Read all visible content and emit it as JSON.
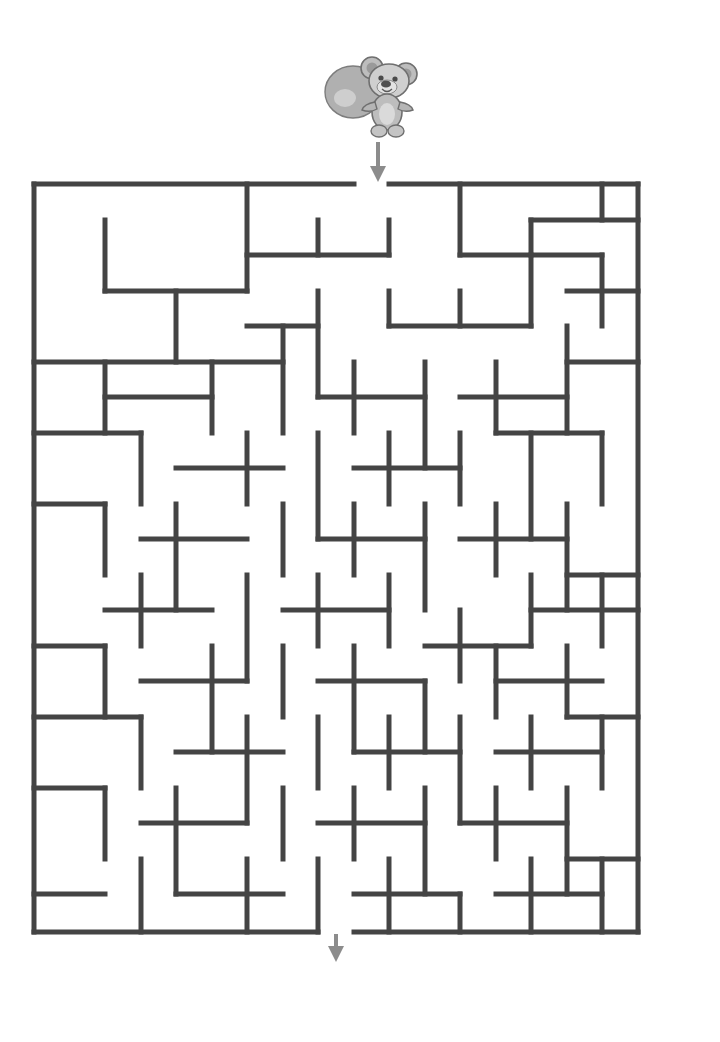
{
  "page": {
    "background_color": "#ffffff"
  },
  "mascot": {
    "name": "koala-bear-with-balloon",
    "description": "Grayscale cartoon koala bear holding a round balloon",
    "x": 320,
    "y": 50,
    "width": 100,
    "height": 92,
    "colors": {
      "body_light": "#c9c9c9",
      "body_mid": "#a8a8a8",
      "body_dark": "#8a8a8a",
      "outline": "#6f6f6f",
      "balloon": "#b3b3b3",
      "balloon_highlight": "#d8d8d8"
    }
  },
  "entry_arrow": {
    "name": "entrance-arrow-down",
    "x": 378,
    "y": 140,
    "length": 40,
    "color": "#8c8c8c"
  },
  "exit_arrow": {
    "name": "exit-arrow-down",
    "x": 336,
    "y": 930,
    "length": 32,
    "color": "#8c8c8c"
  },
  "maze": {
    "origin_x": 34,
    "origin_y": 184,
    "cols": 17,
    "rows": 21,
    "cell": 35.5,
    "wall_color": "#444444",
    "wall_width": 5,
    "entrance": {
      "side": "top",
      "col": 9
    },
    "exit": {
      "side": "bottom",
      "col": 8
    },
    "walls": [
      [
        0,
        0,
        0,
        748,
        "v"
      ],
      [
        604,
        0,
        604,
        748,
        "v"
      ],
      [
        0,
        0,
        320,
        0,
        "h"
      ],
      [
        355,
        0,
        604,
        0,
        "h"
      ],
      [
        0,
        748,
        284,
        748,
        "h"
      ],
      [
        320,
        748,
        604,
        748,
        "h"
      ],
      [
        71,
        36,
        71,
        107,
        "v"
      ],
      [
        213,
        0,
        213,
        107,
        "v"
      ],
      [
        284,
        36,
        284,
        71,
        "v"
      ],
      [
        355,
        36,
        355,
        71,
        "v"
      ],
      [
        426,
        0,
        426,
        71,
        "v"
      ],
      [
        497,
        36,
        497,
        71,
        "v"
      ],
      [
        568,
        0,
        568,
        36,
        "v"
      ],
      [
        71,
        107,
        213,
        107,
        "h"
      ],
      [
        213,
        71,
        355,
        71,
        "h"
      ],
      [
        426,
        71,
        568,
        71,
        "h"
      ],
      [
        497,
        36,
        604,
        36,
        "h"
      ],
      [
        142,
        107,
        142,
        178,
        "v"
      ],
      [
        284,
        107,
        284,
        213,
        "v"
      ],
      [
        355,
        107,
        355,
        142,
        "v"
      ],
      [
        426,
        107,
        426,
        142,
        "v"
      ],
      [
        497,
        71,
        497,
        142,
        "v"
      ],
      [
        568,
        71,
        568,
        142,
        "v"
      ],
      [
        0,
        178,
        249,
        178,
        "h"
      ],
      [
        213,
        142,
        284,
        142,
        "h"
      ],
      [
        355,
        142,
        497,
        142,
        "h"
      ],
      [
        533,
        107,
        604,
        107,
        "h"
      ],
      [
        71,
        178,
        71,
        249,
        "v"
      ],
      [
        178,
        178,
        178,
        249,
        "v"
      ],
      [
        249,
        142,
        249,
        249,
        "v"
      ],
      [
        320,
        178,
        320,
        249,
        "v"
      ],
      [
        391,
        178,
        391,
        284,
        "v"
      ],
      [
        462,
        178,
        462,
        249,
        "v"
      ],
      [
        533,
        142,
        533,
        249,
        "v"
      ],
      [
        71,
        213,
        178,
        213,
        "h"
      ],
      [
        284,
        213,
        391,
        213,
        "h"
      ],
      [
        426,
        213,
        533,
        213,
        "h"
      ],
      [
        533,
        178,
        604,
        178,
        "h"
      ],
      [
        107,
        249,
        107,
        320,
        "v"
      ],
      [
        213,
        249,
        213,
        320,
        "v"
      ],
      [
        284,
        249,
        284,
        355,
        "v"
      ],
      [
        355,
        249,
        355,
        320,
        "v"
      ],
      [
        426,
        249,
        426,
        320,
        "v"
      ],
      [
        497,
        249,
        497,
        355,
        "v"
      ],
      [
        568,
        249,
        568,
        320,
        "v"
      ],
      [
        0,
        249,
        107,
        249,
        "h"
      ],
      [
        142,
        284,
        249,
        284,
        "h"
      ],
      [
        320,
        284,
        426,
        284,
        "h"
      ],
      [
        462,
        249,
        568,
        249,
        "h"
      ],
      [
        71,
        320,
        71,
        391,
        "v"
      ],
      [
        142,
        320,
        142,
        426,
        "v"
      ],
      [
        249,
        320,
        249,
        391,
        "v"
      ],
      [
        320,
        320,
        320,
        391,
        "v"
      ],
      [
        391,
        320,
        391,
        426,
        "v"
      ],
      [
        462,
        320,
        462,
        391,
        "v"
      ],
      [
        533,
        320,
        533,
        426,
        "v"
      ],
      [
        0,
        320,
        71,
        320,
        "h"
      ],
      [
        107,
        355,
        213,
        355,
        "h"
      ],
      [
        284,
        355,
        391,
        355,
        "h"
      ],
      [
        426,
        355,
        533,
        355,
        "h"
      ],
      [
        533,
        391,
        604,
        391,
        "h"
      ],
      [
        107,
        391,
        107,
        462,
        "v"
      ],
      [
        213,
        391,
        213,
        497,
        "v"
      ],
      [
        284,
        391,
        284,
        462,
        "v"
      ],
      [
        355,
        391,
        355,
        462,
        "v"
      ],
      [
        426,
        426,
        426,
        497,
        "v"
      ],
      [
        497,
        391,
        497,
        462,
        "v"
      ],
      [
        568,
        391,
        568,
        462,
        "v"
      ],
      [
        71,
        426,
        178,
        426,
        "h"
      ],
      [
        249,
        426,
        355,
        426,
        "h"
      ],
      [
        391,
        462,
        497,
        462,
        "h"
      ],
      [
        497,
        426,
        604,
        426,
        "h"
      ],
      [
        71,
        462,
        71,
        533,
        "v"
      ],
      [
        178,
        462,
        178,
        568,
        "v"
      ],
      [
        249,
        462,
        249,
        533,
        "v"
      ],
      [
        320,
        462,
        320,
        568,
        "v"
      ],
      [
        391,
        497,
        391,
        568,
        "v"
      ],
      [
        462,
        462,
        462,
        533,
        "v"
      ],
      [
        533,
        462,
        533,
        533,
        "v"
      ],
      [
        0,
        462,
        71,
        462,
        "h"
      ],
      [
        107,
        497,
        213,
        497,
        "h"
      ],
      [
        284,
        497,
        391,
        497,
        "h"
      ],
      [
        462,
        497,
        568,
        497,
        "h"
      ],
      [
        533,
        533,
        604,
        533,
        "h"
      ],
      [
        107,
        533,
        107,
        604,
        "v"
      ],
      [
        213,
        533,
        213,
        639,
        "v"
      ],
      [
        284,
        533,
        284,
        604,
        "v"
      ],
      [
        355,
        533,
        355,
        604,
        "v"
      ],
      [
        426,
        533,
        426,
        639,
        "v"
      ],
      [
        497,
        533,
        497,
        604,
        "v"
      ],
      [
        568,
        533,
        568,
        604,
        "v"
      ],
      [
        0,
        533,
        107,
        533,
        "h"
      ],
      [
        142,
        568,
        249,
        568,
        "h"
      ],
      [
        320,
        568,
        426,
        568,
        "h"
      ],
      [
        462,
        568,
        568,
        568,
        "h"
      ],
      [
        71,
        604,
        71,
        675,
        "v"
      ],
      [
        142,
        604,
        142,
        710,
        "v"
      ],
      [
        249,
        604,
        249,
        675,
        "v"
      ],
      [
        320,
        604,
        320,
        675,
        "v"
      ],
      [
        391,
        604,
        391,
        710,
        "v"
      ],
      [
        462,
        604,
        462,
        675,
        "v"
      ],
      [
        533,
        604,
        533,
        710,
        "v"
      ],
      [
        0,
        604,
        71,
        604,
        "h"
      ],
      [
        107,
        639,
        213,
        639,
        "h"
      ],
      [
        284,
        639,
        391,
        639,
        "h"
      ],
      [
        426,
        639,
        533,
        639,
        "h"
      ],
      [
        533,
        675,
        604,
        675,
        "h"
      ],
      [
        107,
        675,
        107,
        748,
        "v"
      ],
      [
        213,
        675,
        213,
        748,
        "v"
      ],
      [
        284,
        675,
        284,
        748,
        "v"
      ],
      [
        355,
        675,
        355,
        748,
        "v"
      ],
      [
        426,
        710,
        426,
        748,
        "v"
      ],
      [
        497,
        675,
        497,
        748,
        "v"
      ],
      [
        568,
        675,
        568,
        748,
        "v"
      ],
      [
        0,
        710,
        71,
        710,
        "h"
      ],
      [
        142,
        710,
        249,
        710,
        "h"
      ],
      [
        320,
        710,
        426,
        710,
        "h"
      ],
      [
        462,
        710,
        568,
        710,
        "h"
      ]
    ]
  }
}
